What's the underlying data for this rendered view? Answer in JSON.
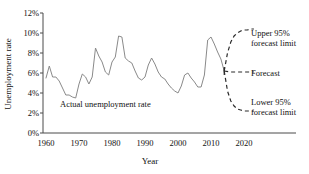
{
  "chart_data": {
    "type": "line",
    "title": "",
    "xlabel": "Year",
    "ylabel": "Unemployment rate",
    "xlim": [
      1958,
      2026
    ],
    "ylim": [
      0,
      12
    ],
    "ytick_labels": [
      "0%",
      "2%",
      "4%",
      "6%",
      "8%",
      "10%",
      "12%"
    ],
    "ytick_values": [
      0,
      2,
      4,
      6,
      8,
      10,
      12
    ],
    "xtick_labels": [
      "1960",
      "1970",
      "1980",
      "1990",
      "2000",
      "2010",
      "2020"
    ],
    "xtick_values": [
      1960,
      1970,
      1980,
      1990,
      2000,
      2010,
      2020
    ],
    "grid": false,
    "legend_position": "right",
    "annotations": [
      {
        "name": "actual-series-label",
        "text": "Actual unemployment rate",
        "x": 1978,
        "y": 2.6
      }
    ],
    "series": [
      {
        "name": "Actual unemployment rate",
        "style": "solid",
        "color": "#8a8a8a",
        "x": [
          1960,
          1961,
          1962,
          1963,
          1964,
          1965,
          1966,
          1967,
          1968,
          1969,
          1970,
          1971,
          1972,
          1973,
          1974,
          1975,
          1976,
          1977,
          1978,
          1979,
          1980,
          1981,
          1982,
          1983,
          1984,
          1985,
          1986,
          1987,
          1988,
          1989,
          1990,
          1991,
          1992,
          1993,
          1994,
          1995,
          1996,
          1997,
          1998,
          1999,
          2000,
          2001,
          2002,
          2003,
          2004,
          2005,
          2006,
          2007,
          2008,
          2009,
          2010,
          2011,
          2012,
          2013,
          2014
        ],
        "y": [
          5.5,
          6.7,
          5.6,
          5.6,
          5.2,
          4.5,
          3.8,
          3.8,
          3.6,
          3.5,
          4.9,
          5.9,
          5.6,
          4.9,
          5.6,
          8.5,
          7.7,
          7.1,
          6.1,
          5.8,
          7.1,
          7.6,
          9.7,
          9.6,
          7.5,
          7.2,
          7.0,
          6.2,
          5.5,
          5.3,
          5.6,
          6.8,
          7.5,
          6.9,
          6.1,
          5.6,
          5.4,
          4.9,
          4.5,
          4.2,
          4.0,
          4.7,
          5.8,
          6.0,
          5.5,
          5.1,
          4.6,
          4.6,
          5.8,
          9.3,
          9.6,
          8.9,
          8.1,
          7.4,
          6.2
        ]
      },
      {
        "name": "Upper 95% forecast limit",
        "style": "dashed",
        "color": "#2b2b2b",
        "x": [
          2014,
          2015,
          2016,
          2017,
          2018,
          2019,
          2020,
          2021,
          2022,
          2023
        ],
        "y": [
          6.2,
          8.0,
          9.1,
          9.7,
          10.0,
          10.2,
          10.3,
          10.3,
          10.4,
          10.4
        ]
      },
      {
        "name": "Forecast",
        "style": "dashed",
        "color": "#2b2b2b",
        "x": [
          2014,
          2016,
          2018,
          2020,
          2022,
          2023
        ],
        "y": [
          6.2,
          6.1,
          6.1,
          6.1,
          6.1,
          6.1
        ]
      },
      {
        "name": "Lower 95% forecast limit",
        "style": "dashed",
        "color": "#2b2b2b",
        "x": [
          2014,
          2015,
          2016,
          2017,
          2018,
          2019,
          2020,
          2021,
          2022,
          2023
        ],
        "y": [
          6.2,
          4.2,
          3.2,
          2.7,
          2.4,
          2.3,
          2.2,
          2.2,
          2.2,
          2.2
        ]
      }
    ],
    "legend_items": [
      {
        "name": "upper-limit",
        "label_line1": "Upper 95%",
        "label_line2": "forecast limit"
      },
      {
        "name": "forecast",
        "label_line1": "Forecast",
        "label_line2": ""
      },
      {
        "name": "lower-limit",
        "label_line1": "Lower 95%",
        "label_line2": "forecast limit"
      }
    ]
  }
}
